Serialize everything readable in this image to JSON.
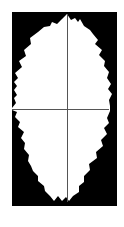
{
  "diagram": {
    "type": "serrated-leaf-outline-with-crosshair",
    "colors": {
      "page_background": "#ffffff",
      "frame_fill": "#000000",
      "shape_fill": "#ffffff",
      "axis_line": "#555555"
    },
    "frame": {
      "x": 12,
      "y": 12,
      "width": 105,
      "height": 194
    },
    "shape_outline": "12,108 16,103 14,98 17,95 14,90 17,86 14,82 18,78 15,73 22,67 19,61 26,56 24,50 31,44 30,38 38,32 44,27 50,26 52,22 57,24 62,19 67,14 71,20 75,18 78,22 80,19 84,26 90,30 93,34 98,40 95,44 102,50 99,55 105,61 104,66 109,72 107,78 111,84 108,89 112,94 109,100 110,106 110,111 107,118 109,123 104,128 107,134 101,140 103,146 96,152 97,158 89,164 90,170 84,176 84,182 79,186 79,192 73,196 69,201 66,197 62,201 58,196 54,201 50,196 45,191 44,186 38,181 38,176 33,171 31,166 28,161 29,155 24,149 25,143 21,138 24,132 18,127 20,122 15,117 17,112 12,110",
    "vertical_axis": {
      "x": 67,
      "y1": 14,
      "y2": 202
    },
    "horizontal_axis": {
      "y": 109,
      "x1": 12,
      "x2": 109
    }
  }
}
